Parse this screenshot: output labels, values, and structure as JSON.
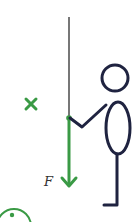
{
  "diagram": {
    "force_label": "F",
    "colors": {
      "force": "#3a9a45",
      "figure": "#1f2340",
      "rope": "#555555",
      "background": "#ffffff"
    },
    "elements": {
      "rope": {
        "x": 69,
        "y1": 17,
        "y2": 118
      },
      "force_arrow": {
        "x": 69,
        "y_start": 118,
        "y_end": 188
      },
      "cross_marker": {
        "x": 31,
        "y": 104
      },
      "figure_head": {
        "cx": 115,
        "cy": 78,
        "r": 13
      },
      "figure_body": {
        "cx": 118,
        "cy": 128,
        "rx": 12,
        "ry": 26
      },
      "partial_circle_marker": {
        "cx": 14,
        "cy": 226,
        "r": 17
      }
    }
  }
}
